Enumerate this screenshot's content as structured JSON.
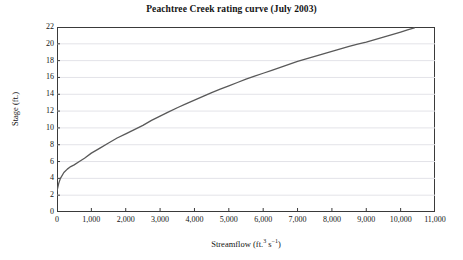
{
  "chart_data": {
    "type": "line",
    "title": "Peachtree Creek rating curve (July 2003)",
    "xlabel_text": "Streamflow (ft.",
    "xlabel_sup1": "3",
    "xlabel_mid": " s",
    "xlabel_sup2": "−1",
    "xlabel_end": ")",
    "xlabel": "Streamflow (ft.3 s-1)",
    "ylabel": "Stage (ft.)",
    "xlim": [
      0,
      11000
    ],
    "ylim": [
      0,
      22
    ],
    "grid": "horizontal",
    "legend": "none",
    "line_color": "#595959",
    "xticks": [
      0,
      1000,
      2000,
      3000,
      4000,
      5000,
      6000,
      7000,
      8000,
      9000,
      10000,
      11000
    ],
    "xtick_labels": [
      "0",
      "1,000",
      "2,000",
      "3,000",
      "4,000",
      "5,000",
      "6,000",
      "7,000",
      "8,000",
      "9,000",
      "10,000",
      "11,000"
    ],
    "yticks": [
      0,
      2,
      4,
      6,
      8,
      10,
      12,
      14,
      16,
      18,
      20,
      22
    ],
    "ytick_labels": [
      "0",
      "2",
      "4",
      "6",
      "8",
      "10",
      "12",
      "14",
      "16",
      "18",
      "20",
      "22"
    ],
    "series": [
      {
        "name": "rating curve",
        "x": [
          0,
          50,
          100,
          200,
          300,
          400,
          500,
          650,
          800,
          1000,
          1250,
          1500,
          1750,
          2000,
          2250,
          2500,
          2750,
          3000,
          3250,
          3500,
          3750,
          4000,
          4250,
          4500,
          4750,
          5000,
          5250,
          5500,
          5750,
          6000,
          6250,
          6500,
          6750,
          7000,
          7250,
          7500,
          7750,
          8000,
          8250,
          8500,
          8750,
          9000,
          9250,
          9500,
          9750,
          10000,
          10200,
          10400
        ],
        "y": [
          2.5,
          3.4,
          4.0,
          4.7,
          5.1,
          5.4,
          5.6,
          6.0,
          6.4,
          7.0,
          7.6,
          8.2,
          8.8,
          9.3,
          9.8,
          10.3,
          10.9,
          11.4,
          11.9,
          12.4,
          12.85,
          13.3,
          13.75,
          14.2,
          14.6,
          15.0,
          15.4,
          15.8,
          16.15,
          16.5,
          16.85,
          17.2,
          17.55,
          17.9,
          18.2,
          18.5,
          18.8,
          19.1,
          19.4,
          19.7,
          19.95,
          20.2,
          20.5,
          20.8,
          21.1,
          21.4,
          21.65,
          21.9
        ]
      }
    ]
  }
}
